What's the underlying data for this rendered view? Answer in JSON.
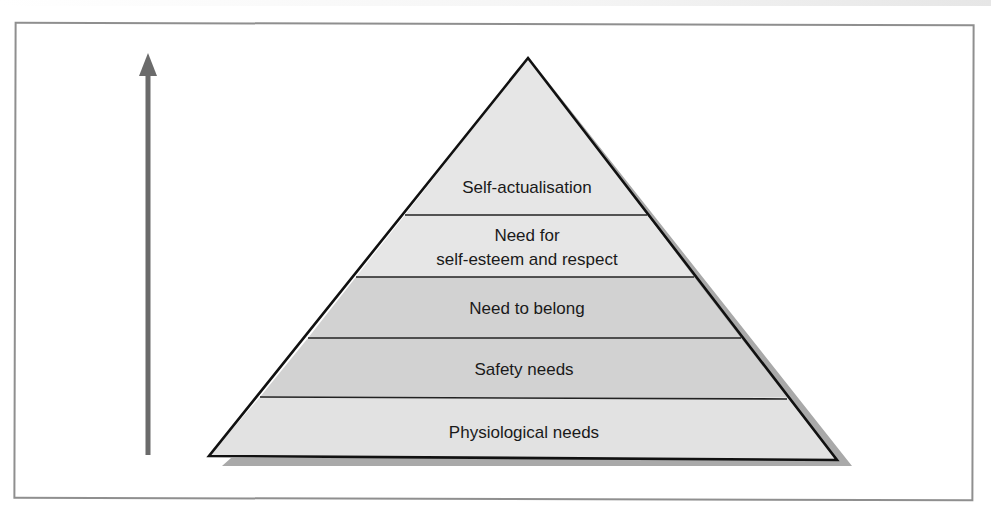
{
  "diagram": {
    "type": "pyramid",
    "arrow": {
      "direction": "up",
      "color": "#6b6b6b"
    },
    "colors": {
      "outline": "#111111",
      "shadow": "#a9a9a9",
      "frame": "#8f8f8f",
      "band_light": "#e4e4e4",
      "band_dark": "#d2d2d2"
    },
    "levels": [
      {
        "order": 5,
        "lines": [
          "Self-actualisation"
        ],
        "fill": "#e6e6e6"
      },
      {
        "order": 4,
        "lines": [
          "Need for",
          "self-esteem and respect"
        ],
        "fill": "#e6e6e6"
      },
      {
        "order": 3,
        "lines": [
          "Need to belong"
        ],
        "fill": "#d2d2d2"
      },
      {
        "order": 2,
        "lines": [
          "Safety needs"
        ],
        "fill": "#d2d2d2"
      },
      {
        "order": 1,
        "lines": [
          "Physiological needs"
        ],
        "fill": "#e2e2e2"
      }
    ]
  }
}
